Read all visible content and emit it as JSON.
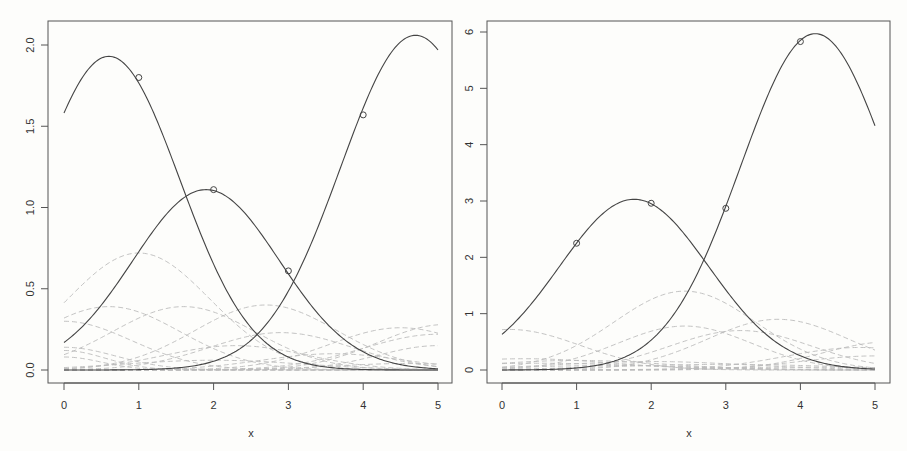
{
  "chart_data": [
    {
      "type": "line",
      "panel": "left",
      "title": "",
      "xlabel": "x",
      "ylabel": "",
      "xlim": [
        0,
        5
      ],
      "ylim": [
        0,
        2.0
      ],
      "x_ticks": [
        "0",
        "1",
        "2",
        "3",
        "4",
        "5"
      ],
      "y_ticks": [
        "0.0",
        "0.5",
        "1.0",
        "1.5",
        "2.0"
      ],
      "grid": false,
      "legend": null,
      "series": [
        {
          "name": "curve-1",
          "style": "solid",
          "gaussian": {
            "amp": 1.93,
            "mu": 0.6,
            "sigma": 0.95
          },
          "approx_values": {
            "x": [
              0,
              1,
              2,
              3,
              4,
              5
            ],
            "y": [
              1.6,
              1.8,
              1.1,
              0.12,
              0.02,
              0.01
            ]
          }
        },
        {
          "name": "curve-2",
          "style": "solid",
          "gaussian": {
            "amp": 1.11,
            "mu": 1.9,
            "sigma": 0.98
          },
          "approx_values": {
            "x": [
              0,
              1,
              2,
              3,
              4,
              5
            ],
            "y": [
              0.18,
              0.72,
              1.11,
              0.61,
              0.12,
              0.01
            ]
          }
        },
        {
          "name": "curve-3",
          "style": "solid",
          "gaussian": {
            "amp": 2.06,
            "mu": 4.7,
            "sigma": 1.0
          },
          "approx_values": {
            "x": [
              0,
              1,
              2,
              3,
              4,
              5
            ],
            "y": [
              0.0,
              0.0,
              0.05,
              0.5,
              1.57,
              2.0
            ]
          }
        }
      ],
      "markers": [
        {
          "x": 1,
          "y": 1.8
        },
        {
          "x": 2,
          "y": 1.11
        },
        {
          "x": 3,
          "y": 0.61
        },
        {
          "x": 4,
          "y": 1.57
        }
      ],
      "background_series": [
        {
          "amp": 0.72,
          "mu": 1.0,
          "sigma": 0.95
        },
        {
          "amp": 0.39,
          "mu": 0.6,
          "sigma": 0.95
        },
        {
          "amp": 0.39,
          "mu": 1.6,
          "sigma": 0.95
        },
        {
          "amp": 0.4,
          "mu": 2.7,
          "sigma": 0.95
        },
        {
          "amp": 0.3,
          "mu": 0.0,
          "sigma": 0.9
        },
        {
          "amp": 0.23,
          "mu": 2.9,
          "sigma": 0.95
        },
        {
          "amp": 0.26,
          "mu": 4.5,
          "sigma": 0.95
        },
        {
          "amp": 0.28,
          "mu": 5.1,
          "sigma": 0.9
        },
        {
          "amp": 0.22,
          "mu": 5.0,
          "sigma": 1.0
        },
        {
          "amp": 0.15,
          "mu": 2.3,
          "sigma": 0.95
        },
        {
          "amp": 0.14,
          "mu": 0.0,
          "sigma": 0.7
        },
        {
          "amp": 0.12,
          "mu": 0.0,
          "sigma": 0.55
        },
        {
          "amp": 0.1,
          "mu": 3.6,
          "sigma": 0.95
        },
        {
          "amp": 0.15,
          "mu": 5.0,
          "sigma": 0.8
        },
        {
          "amp": 0.08,
          "mu": 0.0,
          "sigma": 0.5
        },
        {
          "amp": 0.06,
          "mu": 2.0,
          "sigma": 1.2
        },
        {
          "amp": 0.04,
          "mu": 4.6,
          "sigma": 1.0
        }
      ]
    },
    {
      "type": "line",
      "panel": "right",
      "title": "",
      "xlabel": "x",
      "ylabel": "",
      "xlim": [
        0,
        5
      ],
      "ylim": [
        0,
        6
      ],
      "x_ticks": [
        "0",
        "1",
        "2",
        "3",
        "4",
        "5"
      ],
      "y_ticks": [
        "0",
        "1",
        "2",
        "3",
        "4",
        "5",
        "6"
      ],
      "grid": false,
      "legend": null,
      "series": [
        {
          "name": "curve-1",
          "style": "solid",
          "gaussian": {
            "amp": 3.03,
            "mu": 1.77,
            "sigma": 1.0
          },
          "approx_values": {
            "x": [
              0,
              1,
              2,
              3,
              4,
              5
            ],
            "y": [
              0.65,
              2.25,
              2.96,
              1.4,
              0.2,
              0.02
            ]
          }
        },
        {
          "name": "curve-2",
          "style": "solid",
          "gaussian": {
            "amp": 5.97,
            "mu": 4.2,
            "sigma": 1.0
          },
          "approx_values": {
            "x": [
              0,
              1,
              2,
              3,
              4,
              5
            ],
            "y": [
              0.0,
              0.04,
              0.3,
              2.87,
              5.83,
              4.4
            ]
          }
        }
      ],
      "markers": [
        {
          "x": 1,
          "y": 2.25
        },
        {
          "x": 2,
          "y": 2.96
        },
        {
          "x": 3,
          "y": 2.87
        },
        {
          "x": 4,
          "y": 5.83
        }
      ],
      "background_series": [
        {
          "amp": 1.4,
          "mu": 2.45,
          "sigma": 0.95
        },
        {
          "amp": 0.78,
          "mu": 2.45,
          "sigma": 0.9
        },
        {
          "amp": 0.9,
          "mu": 3.7,
          "sigma": 0.95
        },
        {
          "amp": 0.72,
          "mu": 0.1,
          "sigma": 0.95
        },
        {
          "amp": 0.7,
          "mu": 3.2,
          "sigma": 0.95
        },
        {
          "amp": 0.5,
          "mu": 5.2,
          "sigma": 0.9
        },
        {
          "amp": 0.4,
          "mu": 4.8,
          "sigma": 1.0
        },
        {
          "amp": 0.2,
          "mu": 0.3,
          "sigma": 1.2
        },
        {
          "amp": 0.17,
          "mu": 1.0,
          "sigma": 1.2
        },
        {
          "amp": 0.15,
          "mu": 2.0,
          "sigma": 1.3
        },
        {
          "amp": 0.12,
          "mu": 0.5,
          "sigma": 1.5
        },
        {
          "amp": 0.25,
          "mu": 5.0,
          "sigma": 1.0
        },
        {
          "amp": 0.1,
          "mu": 3.0,
          "sigma": 1.5
        },
        {
          "amp": 0.08,
          "mu": 1.5,
          "sigma": 1.3
        },
        {
          "amp": 0.05,
          "mu": 4.0,
          "sigma": 1.2
        }
      ]
    }
  ],
  "panels": {
    "left": {
      "xlabel": "x",
      "x_tick_labels": [
        "0",
        "1",
        "2",
        "3",
        "4",
        "5"
      ],
      "y_tick_labels": [
        "0.0",
        "0.5",
        "1.0",
        "1.5",
        "2.0"
      ]
    },
    "right": {
      "xlabel": "x",
      "x_tick_labels": [
        "0",
        "1",
        "2",
        "3",
        "4",
        "5"
      ],
      "y_tick_labels": [
        "0",
        "1",
        "2",
        "3",
        "4",
        "5",
        "6"
      ]
    }
  }
}
